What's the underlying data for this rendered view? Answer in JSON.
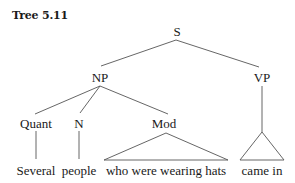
{
  "title": "Tree 5.11",
  "tree": {
    "root": "S",
    "nodes": {
      "S": "S",
      "NP": "NP",
      "VP": "VP",
      "Quant": "Quant",
      "N": "N",
      "Mod": "Mod"
    },
    "leaves": {
      "quant": "Several",
      "n": "people",
      "mod": "who were wearing hats",
      "vp": "came in"
    },
    "structure": "[S [NP [Quant Several] [N people] [Mod who were wearing hats]] [VP came in]]"
  }
}
